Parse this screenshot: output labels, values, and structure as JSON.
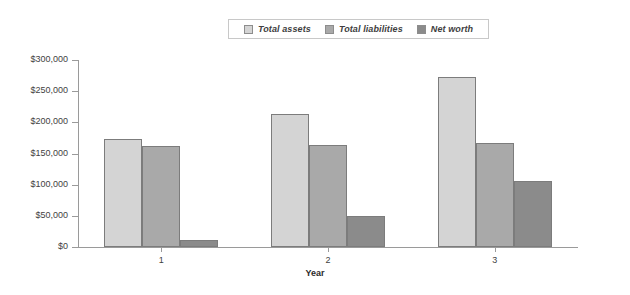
{
  "chart_data": {
    "type": "bar",
    "title": "",
    "xlabel": "Year",
    "ylabel": "",
    "categories": [
      "1",
      "2",
      "3"
    ],
    "series": [
      {
        "name": "Total assets",
        "color": "#d4d4d4",
        "values": [
          173000,
          214000,
          273000
        ]
      },
      {
        "name": "Total liabilities",
        "color": "#a9a9a9",
        "values": [
          162000,
          164000,
          167000
        ]
      },
      {
        "name": "Net worth",
        "color": "#8b8b8b",
        "values": [
          11000,
          49000,
          106000
        ]
      }
    ],
    "ylim": [
      0,
      300000
    ],
    "ytick_labels": [
      "$0",
      "$50,000",
      "$100,000",
      "$150,000",
      "$200,000",
      "$250,000",
      "$300,000"
    ],
    "ytick_values": [
      0,
      50000,
      100000,
      150000,
      200000,
      250000,
      300000
    ],
    "grid": false,
    "legend_position": "top-center",
    "border_color": "#7c7c7c",
    "axis_color": "#9a9a9a"
  },
  "legend": {
    "items": [
      {
        "label": "Total assets"
      },
      {
        "label": "Total liabilities"
      },
      {
        "label": "Net worth"
      }
    ]
  },
  "axes": {
    "x_title": "Year"
  }
}
